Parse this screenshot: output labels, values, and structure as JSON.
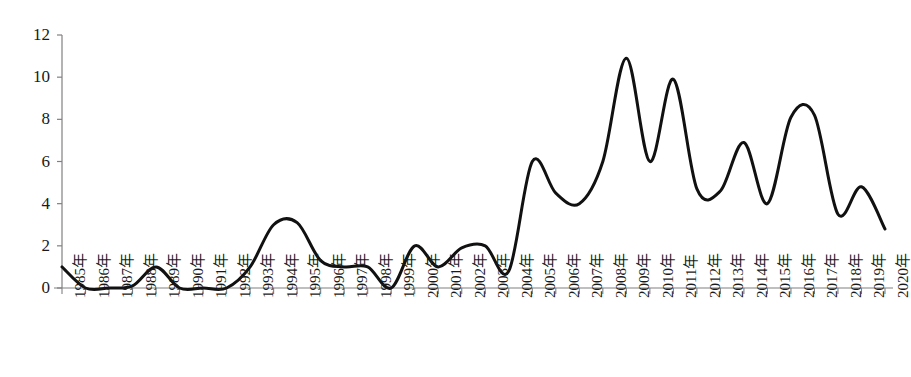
{
  "chart_data": {
    "type": "line",
    "title": "",
    "subtitle": "",
    "xlabel": "",
    "ylabel": "",
    "categories": [
      "1985年",
      "1986年",
      "1987年",
      "1988年",
      "1989年",
      "1990年",
      "1991年",
      "1992年",
      "1993年",
      "1994年",
      "1995年",
      "1996年",
      "1997年",
      "1998年",
      "1999年",
      "2000年",
      "2001年",
      "2002年",
      "2003年",
      "2004年",
      "2005年",
      "2006年",
      "2007年",
      "2008年",
      "2009年",
      "2010年",
      "2011年",
      "2012年",
      "2013年",
      "2014年",
      "2015年",
      "2016年",
      "2017年",
      "2018年",
      "2019年",
      "2020年"
    ],
    "values": [
      1.0,
      0.0,
      0.0,
      0.1,
      1.0,
      0.0,
      0.0,
      0.0,
      1.0,
      3.0,
      3.1,
      1.3,
      1.0,
      1.0,
      0.0,
      2.0,
      1.0,
      1.9,
      2.0,
      0.8,
      6.0,
      4.5,
      4.0,
      6.0,
      10.9,
      6.0,
      9.9,
      4.7,
      4.6,
      6.9,
      4.0,
      8.1,
      8.2,
      3.5,
      4.8,
      2.8
    ],
    "ylim": [
      0,
      12
    ],
    "yticks": [
      0,
      2,
      4,
      6,
      8,
      10,
      12
    ],
    "xlim_labels": [
      "1985年",
      "2020年"
    ],
    "grid": false,
    "legend": "none",
    "series_name": "",
    "line_color": "#111111",
    "line_width": 3,
    "axis_color": "#808080",
    "smoothing": "spline"
  },
  "axes": {
    "y_tick_labels": [
      "12",
      "10",
      "8",
      "6",
      "4",
      "2",
      "0"
    ],
    "x_tick_labels": [
      "1985年",
      "1986年",
      "1987年",
      "1988年",
      "1989年",
      "1990年",
      "1991年",
      "1992年",
      "1993年",
      "1994年",
      "1995年",
      "1996年",
      "1997年",
      "1998年",
      "1999年",
      "2000年",
      "2001年",
      "2002年",
      "2003年",
      "2004年",
      "2005年",
      "2006年",
      "2007年",
      "2008年",
      "2009年",
      "2010年",
      "2011年",
      "2012年",
      "2013年",
      "2014年",
      "2015年",
      "2016年",
      "2017年",
      "2018年",
      "2019年",
      "2020年"
    ]
  }
}
